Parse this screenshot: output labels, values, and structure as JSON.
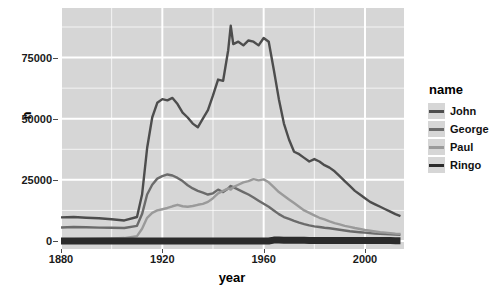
{
  "chart_data": {
    "type": "line",
    "title": "",
    "xlabel": "year",
    "ylabel": "n",
    "xlim": [
      1880,
      2015
    ],
    "ylim": [
      0,
      92000
    ],
    "grid": true,
    "legend_position": "right",
    "legend_title": "name",
    "xticks": [
      1880,
      1920,
      1960,
      2000
    ],
    "xtick_labels": [
      "1880",
      "1920",
      "1960",
      "2000"
    ],
    "yticks": [
      0,
      25000,
      50000,
      75000
    ],
    "ytick_labels": [
      "0",
      "25000",
      "50000",
      "75000"
    ],
    "colors": {
      "John": "#4d4d4d",
      "George": "#6b6b6b",
      "Paul": "#9a9a9a",
      "Ringo": "#2b2b2b",
      "panel_background": "#d6d6d6",
      "gridline": "#ffffff",
      "page_background": "#ffffff"
    },
    "x": [
      1880,
      1885,
      1890,
      1895,
      1900,
      1905,
      1910,
      1912,
      1914,
      1916,
      1918,
      1920,
      1922,
      1924,
      1926,
      1928,
      1930,
      1932,
      1934,
      1936,
      1938,
      1940,
      1942,
      1944,
      1946,
      1947,
      1948,
      1950,
      1952,
      1954,
      1956,
      1958,
      1960,
      1962,
      1964,
      1966,
      1968,
      1970,
      1972,
      1974,
      1976,
      1978,
      1980,
      1982,
      1984,
      1986,
      1988,
      1990,
      1992,
      1994,
      1996,
      1998,
      2000,
      2002,
      2004,
      2006,
      2008,
      2010,
      2012,
      2014
    ],
    "series": [
      {
        "name": "John",
        "color": "#4d4d4d",
        "values": [
          9655,
          9800,
          9500,
          9300,
          8900,
          8400,
          9800,
          19000,
          38000,
          50500,
          56500,
          58000,
          57500,
          58500,
          56000,
          52500,
          50500,
          48000,
          46500,
          50000,
          53500,
          59500,
          66000,
          65500,
          78000,
          88000,
          80500,
          81500,
          80000,
          82000,
          81500,
          80000,
          83000,
          81500,
          70000,
          58000,
          48000,
          41500,
          36500,
          35500,
          34000,
          32500,
          33500,
          32500,
          31000,
          30000,
          28500,
          26500,
          24500,
          22500,
          20500,
          19000,
          17500,
          16000,
          15000,
          14000,
          13000,
          12000,
          11000,
          10200
        ]
      },
      {
        "name": "George",
        "color": "#6b6b6b",
        "values": [
          5530,
          5700,
          5600,
          5450,
          5400,
          5300,
          6200,
          11000,
          19000,
          23000,
          25500,
          26500,
          27200,
          26800,
          25800,
          24500,
          22800,
          21500,
          20500,
          19800,
          19000,
          19500,
          21000,
          20000,
          21500,
          22500,
          22000,
          21000,
          20000,
          19000,
          17800,
          16500,
          15200,
          14000,
          12500,
          11000,
          9800,
          9000,
          8200,
          7500,
          6900,
          6400,
          6000,
          5700,
          5400,
          5200,
          4900,
          4600,
          4300,
          4000,
          3800,
          3600,
          3400,
          3200,
          3000,
          2900,
          2800,
          2700,
          2600,
          2500
        ]
      },
      {
        "name": "Paul",
        "color": "#9a9a9a",
        "values": [
          600,
          700,
          800,
          900,
          1000,
          1200,
          2000,
          5000,
          9500,
          11500,
          12500,
          13000,
          13500,
          14200,
          14800,
          14200,
          14000,
          14300,
          14800,
          15200,
          16000,
          17500,
          19500,
          20500,
          21500,
          21000,
          22000,
          23000,
          24000,
          24500,
          25300,
          24800,
          25200,
          24000,
          22000,
          20000,
          18500,
          17000,
          15500,
          14000,
          12500,
          11500,
          10500,
          9500,
          8800,
          8000,
          7300,
          6800,
          6200,
          5800,
          5300,
          4900,
          4500,
          4200,
          3900,
          3600,
          3400,
          3200,
          3000,
          2900
        ]
      },
      {
        "name": "Ringo",
        "color": "#2b2b2b",
        "values": [
          0,
          0,
          0,
          0,
          0,
          0,
          0,
          0,
          0,
          0,
          0,
          0,
          0,
          0,
          0,
          0,
          0,
          0,
          0,
          0,
          0,
          0,
          0,
          0,
          0,
          0,
          0,
          0,
          0,
          0,
          0,
          0,
          0,
          0,
          360,
          380,
          340,
          320,
          300,
          280,
          260,
          250,
          240,
          230,
          220,
          215,
          210,
          205,
          200,
          195,
          190,
          185,
          180,
          175,
          170,
          165,
          160,
          155,
          150,
          145
        ]
      }
    ],
    "ringo_bar": {
      "start_year": 1963,
      "end_year": 2015,
      "note": "Ringo line drawn as a thick near-zero band"
    }
  },
  "legend": {
    "title": "name",
    "items": [
      {
        "label": "John",
        "color": "#4d4d4d"
      },
      {
        "label": "George",
        "color": "#6b6b6b"
      },
      {
        "label": "Paul",
        "color": "#9a9a9a"
      },
      {
        "label": "Ringo",
        "color": "#2b2b2b"
      }
    ]
  },
  "axes": {
    "x_title": "year",
    "y_title": "n",
    "x_labels": [
      "1880",
      "1920",
      "1960",
      "2000"
    ],
    "y_labels": [
      "0",
      "25000",
      "50000",
      "75000"
    ]
  }
}
